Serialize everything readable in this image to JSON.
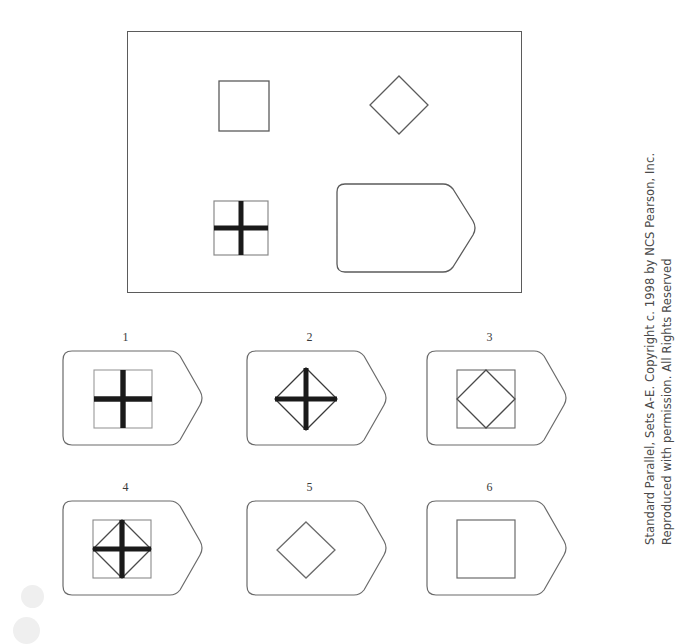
{
  "document": {
    "type": "non-verbal-reasoning-test-item",
    "title": "Standard Parallel Matrix Item"
  },
  "stimulus": {
    "label": "stimulus-box",
    "border_color": "#5b5b5b",
    "shapes": [
      {
        "name": "plain-square",
        "kind": "square",
        "row": 1,
        "col": 1
      },
      {
        "name": "plain-diamond",
        "kind": "diamond",
        "row": 1,
        "col": 2
      },
      {
        "name": "square-with-cross",
        "kind": "square-cross",
        "row": 2,
        "col": 1
      },
      {
        "name": "plain-pentagon",
        "kind": "pentagon",
        "row": 2,
        "col": 2
      }
    ]
  },
  "options": [
    {
      "number": "1",
      "contents": "square-with-bold-cross",
      "inner": "square-cross"
    },
    {
      "number": "2",
      "contents": "diamond-with-bold-cross",
      "inner": "diamond-cross"
    },
    {
      "number": "3",
      "contents": "square-with-inscribed-diamond",
      "inner": "square-diamond"
    },
    {
      "number": "4",
      "contents": "square-with-diamond-and-bold-cross",
      "inner": "square-diamond-cross"
    },
    {
      "number": "5",
      "contents": "plain-diamond",
      "inner": "diamond"
    },
    {
      "number": "6",
      "contents": "plain-square",
      "inner": "square"
    }
  ],
  "credit": {
    "line1": "Standard Parallel, Sets A-E. Copyright c. 1998 by NCS Pearson, Inc.",
    "line2": "Reproduced with permission. All Rights Reserved"
  },
  "colors": {
    "outline": "#5b5b5b",
    "bold_stroke": "#1a1a1a",
    "background": "#ffffff",
    "text": "#3a3a3a"
  }
}
